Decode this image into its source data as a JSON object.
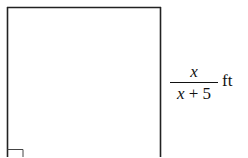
{
  "figure": {
    "shape": "rectangle",
    "stroke_color": "#222222",
    "background": "#ffffff",
    "right_angle_marker": true,
    "side_label": {
      "numerator": "x",
      "denominator_var": "x",
      "denominator_rest": " + 5",
      "unit": "ft"
    }
  }
}
